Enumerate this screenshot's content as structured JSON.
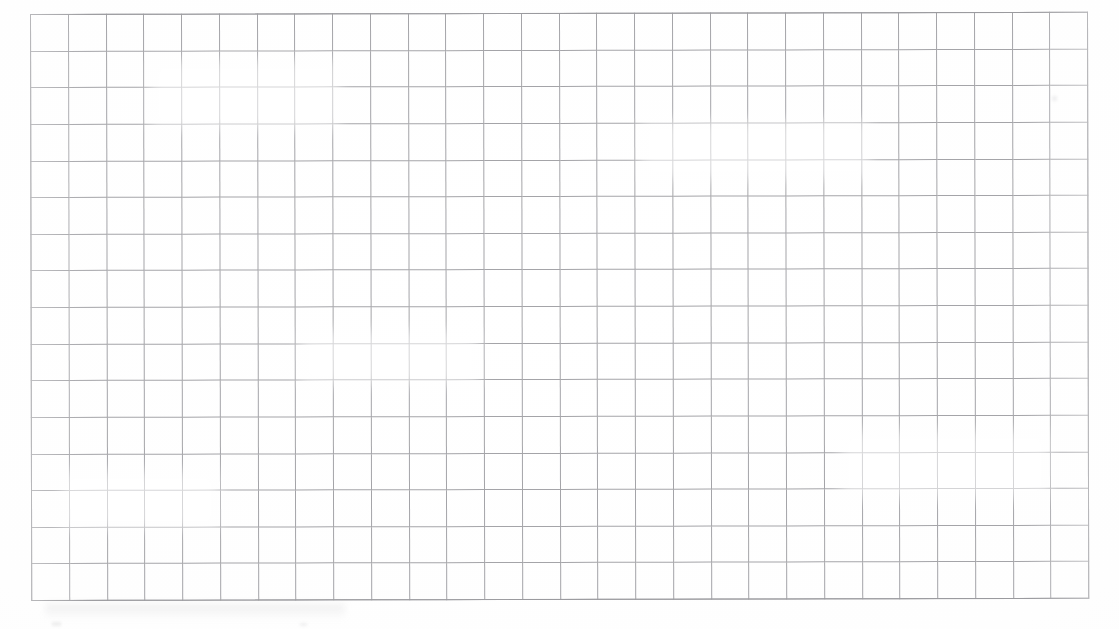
{
  "document": {
    "kind": "scanned-grid-paper",
    "title": "Blank grid paper scan",
    "page_width": 1119,
    "page_height": 629,
    "background_color": "#ffffff"
  },
  "grid": {
    "columns": 28,
    "rows": 16,
    "left": 30,
    "top": 14,
    "width": 1058,
    "height": 587,
    "cell_width": 37.8,
    "cell_height": 36.7,
    "line_color": "#a4a4a8",
    "frame_color": "#9a9a9e",
    "line_width": 1,
    "skew_degrees": -0.12
  },
  "content": {
    "has_text": false,
    "has_drawings": false,
    "has_data_marks": false,
    "note": ""
  },
  "artifacts": {
    "scan_smudge_label": "",
    "speck_label": ""
  },
  "margins": {
    "left_label": "",
    "top_label": "",
    "right_label": "",
    "bottom_label": ""
  }
}
